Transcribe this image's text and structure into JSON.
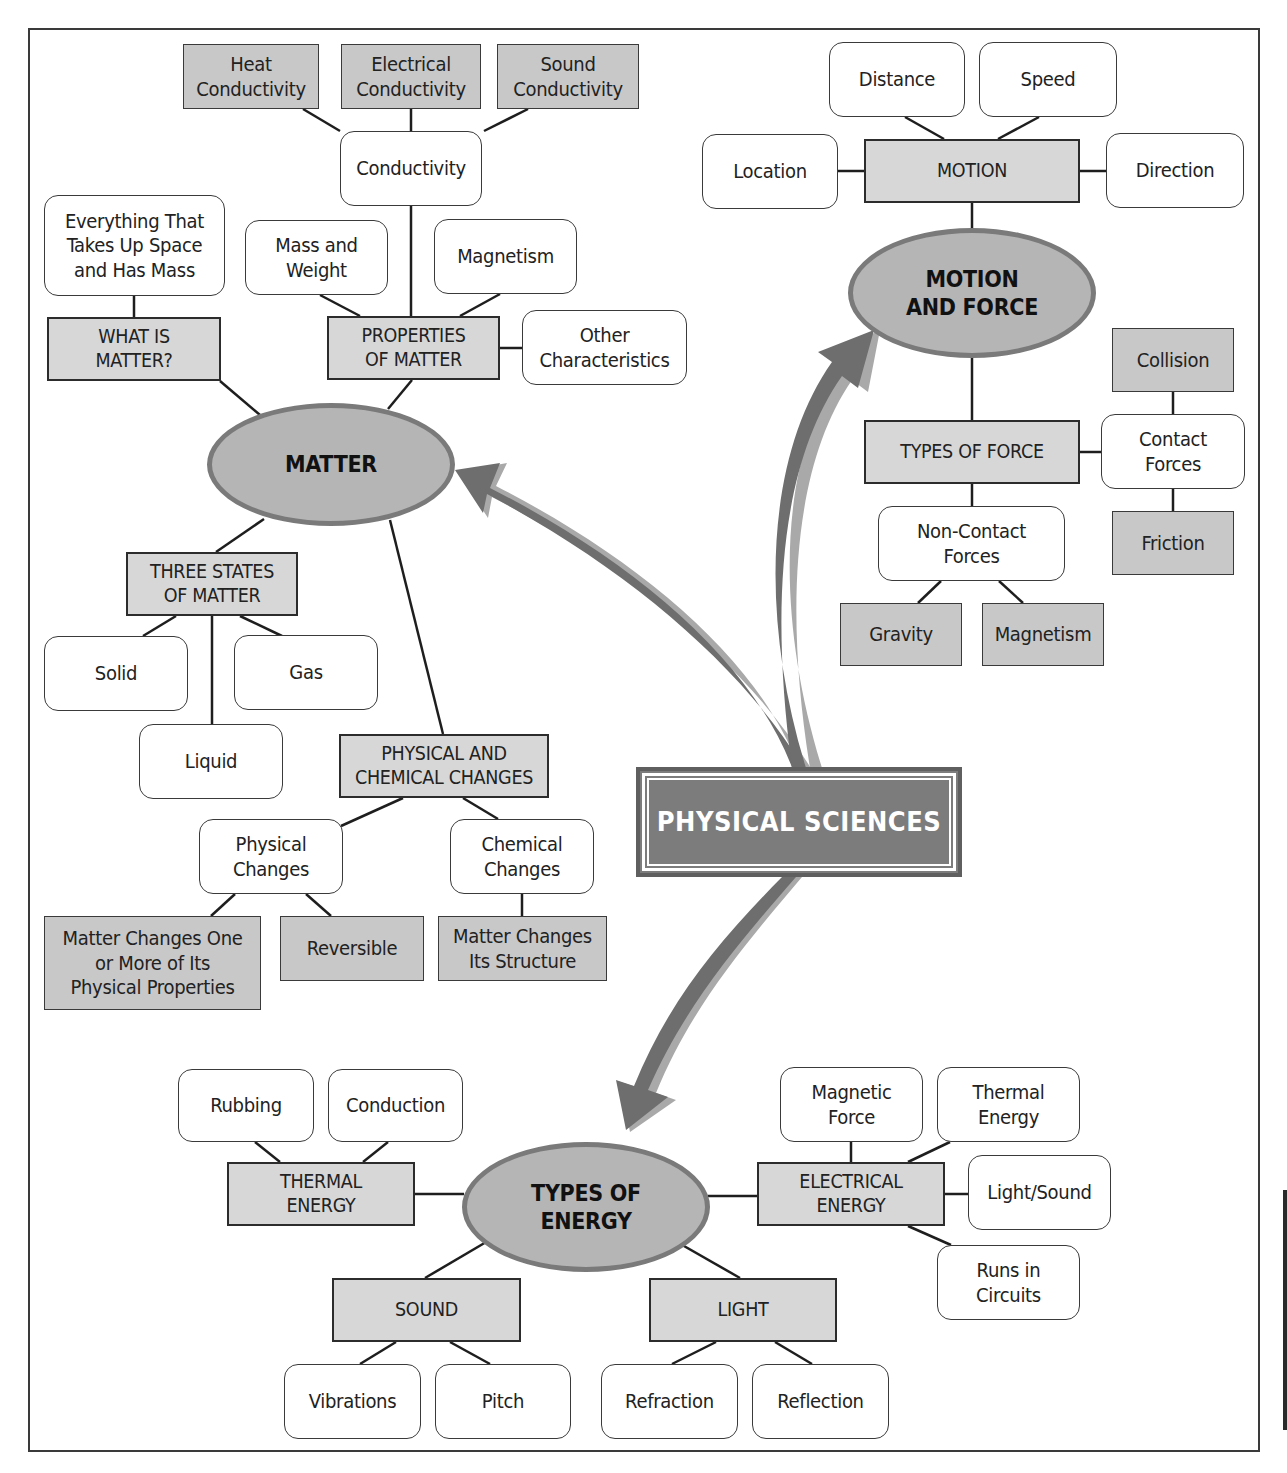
{
  "title": "PHYSICAL SCIENCES",
  "colors": {
    "root_fill": "#7c7c7c",
    "oval_fill": "#b5b5b5",
    "oval_border": "#7a7a7a",
    "category_fill": "#d7d7d7",
    "leaf_fill": "#c8c8c8",
    "detail_fill": "#ffffff",
    "arrow_fill": "#6e6e6e",
    "arrow_shadow": "#a9a9a9",
    "line": "#1e1e1e"
  },
  "nodes": {
    "root": {
      "label": "PHYSICAL SCIENCES",
      "type": "root",
      "x": 636,
      "y": 767,
      "w": 326,
      "h": 110
    },
    "matter": {
      "label": "MATTER",
      "type": "oval",
      "x": 207,
      "y": 403,
      "w": 248,
      "h": 123
    },
    "motion_force": {
      "label": "MOTION\nAND FORCE",
      "type": "oval",
      "x": 848,
      "y": 228,
      "w": 248,
      "h": 130
    },
    "types_energy": {
      "label": "TYPES OF\nENERGY",
      "type": "oval",
      "x": 462,
      "y": 1142,
      "w": 248,
      "h": 130
    },
    "heat_cond": {
      "label": "Heat\nConductivity",
      "type": "leaf",
      "x": 183,
      "y": 44,
      "w": 136,
      "h": 65
    },
    "elec_cond": {
      "label": "Electrical\nConductivity",
      "type": "leaf",
      "x": 341,
      "y": 44,
      "w": 140,
      "h": 65
    },
    "sound_cond": {
      "label": "Sound\nConductivity",
      "type": "leaf",
      "x": 497,
      "y": 44,
      "w": 142,
      "h": 65
    },
    "conductivity": {
      "label": "Conductivity",
      "type": "round",
      "x": 340,
      "y": 131,
      "w": 142,
      "h": 75
    },
    "everything": {
      "label": "Everything That\nTakes Up Space\nand Has Mass",
      "type": "round",
      "x": 44,
      "y": 195,
      "w": 181,
      "h": 101
    },
    "mass_weight": {
      "label": "Mass and\nWeight",
      "type": "round",
      "x": 245,
      "y": 220,
      "w": 143,
      "h": 75
    },
    "magnetism_p": {
      "label": "Magnetism",
      "type": "round",
      "x": 434,
      "y": 219,
      "w": 143,
      "h": 75
    },
    "what_is_matter": {
      "label": "WHAT IS\nMATTER?",
      "type": "cat",
      "x": 47,
      "y": 317,
      "w": 174,
      "h": 64
    },
    "properties": {
      "label": "PROPERTIES\nOF MATTER",
      "type": "cat",
      "x": 327,
      "y": 316,
      "w": 173,
      "h": 64
    },
    "other_char": {
      "label": "Other\nCharacteristics",
      "type": "round",
      "x": 522,
      "y": 310,
      "w": 165,
      "h": 75
    },
    "three_states": {
      "label": "THREE STATES\nOF MATTER",
      "type": "cat",
      "x": 126,
      "y": 552,
      "w": 172,
      "h": 64
    },
    "solid": {
      "label": "Solid",
      "type": "round",
      "x": 44,
      "y": 636,
      "w": 144,
      "h": 75
    },
    "gas": {
      "label": "Gas",
      "type": "round",
      "x": 234,
      "y": 635,
      "w": 144,
      "h": 75
    },
    "liquid": {
      "label": "Liquid",
      "type": "round",
      "x": 139,
      "y": 724,
      "w": 144,
      "h": 75
    },
    "phys_chem": {
      "label": "PHYSICAL AND\nCHEMICAL CHANGES",
      "type": "cat",
      "x": 339,
      "y": 734,
      "w": 210,
      "h": 64
    },
    "physical_changes": {
      "label": "Physical\nChanges",
      "type": "round",
      "x": 199,
      "y": 819,
      "w": 144,
      "h": 75
    },
    "chemical_changes": {
      "label": "Chemical\nChanges",
      "type": "round",
      "x": 450,
      "y": 819,
      "w": 144,
      "h": 75
    },
    "matter_changes_one": {
      "label": "Matter Changes One\nor More of Its\nPhysical Properties",
      "type": "leaf",
      "x": 44,
      "y": 916,
      "w": 217,
      "h": 94
    },
    "reversible": {
      "label": "Reversible",
      "type": "leaf",
      "x": 280,
      "y": 916,
      "w": 144,
      "h": 65
    },
    "matter_changes_struct": {
      "label": "Matter Changes\nIts Structure",
      "type": "leaf",
      "x": 438,
      "y": 916,
      "w": 169,
      "h": 65
    },
    "distance": {
      "label": "Distance",
      "type": "round",
      "x": 829,
      "y": 42,
      "w": 136,
      "h": 75
    },
    "speed": {
      "label": "Speed",
      "type": "round",
      "x": 979,
      "y": 42,
      "w": 138,
      "h": 75
    },
    "location": {
      "label": "Location",
      "type": "round",
      "x": 702,
      "y": 134,
      "w": 136,
      "h": 75
    },
    "motion": {
      "label": "MOTION",
      "type": "cat",
      "x": 864,
      "y": 139,
      "w": 216,
      "h": 64
    },
    "direction": {
      "label": "Direction",
      "type": "round",
      "x": 1106,
      "y": 133,
      "w": 138,
      "h": 75
    },
    "collision": {
      "label": "Collision",
      "type": "leaf",
      "x": 1112,
      "y": 328,
      "w": 122,
      "h": 64
    },
    "types_force": {
      "label": "TYPES OF FORCE",
      "type": "cat",
      "x": 864,
      "y": 420,
      "w": 216,
      "h": 64
    },
    "contact_forces": {
      "label": "Contact\nForces",
      "type": "round",
      "x": 1101,
      "y": 414,
      "w": 144,
      "h": 75
    },
    "non_contact": {
      "label": "Non-Contact\nForces",
      "type": "round",
      "x": 878,
      "y": 506,
      "w": 187,
      "h": 75
    },
    "friction": {
      "label": "Friction",
      "type": "leaf",
      "x": 1112,
      "y": 511,
      "w": 122,
      "h": 64
    },
    "gravity": {
      "label": "Gravity",
      "type": "leaf",
      "x": 840,
      "y": 603,
      "w": 122,
      "h": 63
    },
    "magnetism_f": {
      "label": "Magnetism",
      "type": "leaf",
      "x": 982,
      "y": 603,
      "w": 122,
      "h": 63
    },
    "rubbing": {
      "label": "Rubbing",
      "type": "round",
      "x": 178,
      "y": 1069,
      "w": 136,
      "h": 73
    },
    "conduction": {
      "label": "Conduction",
      "type": "round",
      "x": 328,
      "y": 1069,
      "w": 135,
      "h": 73
    },
    "thermal_energy_cat": {
      "label": "THERMAL\nENERGY",
      "type": "cat",
      "x": 227,
      "y": 1162,
      "w": 188,
      "h": 64
    },
    "sound": {
      "label": "SOUND",
      "type": "cat",
      "x": 332,
      "y": 1278,
      "w": 189,
      "h": 64
    },
    "light": {
      "label": "LIGHT",
      "type": "cat",
      "x": 649,
      "y": 1278,
      "w": 188,
      "h": 64
    },
    "vibrations": {
      "label": "Vibrations",
      "type": "round",
      "x": 284,
      "y": 1364,
      "w": 137,
      "h": 75
    },
    "pitch": {
      "label": "Pitch",
      "type": "round",
      "x": 435,
      "y": 1364,
      "w": 136,
      "h": 75
    },
    "refraction": {
      "label": "Refraction",
      "type": "round",
      "x": 601,
      "y": 1364,
      "w": 137,
      "h": 75
    },
    "reflection": {
      "label": "Reflection",
      "type": "round",
      "x": 752,
      "y": 1364,
      "w": 137,
      "h": 75
    },
    "electrical_energy": {
      "label": "ELECTRICAL\nENERGY",
      "type": "cat",
      "x": 757,
      "y": 1162,
      "w": 188,
      "h": 64
    },
    "magnetic_force": {
      "label": "Magnetic\nForce",
      "type": "round",
      "x": 780,
      "y": 1067,
      "w": 143,
      "h": 75
    },
    "thermal_energy_leaf": {
      "label": "Thermal\nEnergy",
      "type": "round",
      "x": 937,
      "y": 1067,
      "w": 143,
      "h": 75
    },
    "light_sound": {
      "label": "Light/Sound",
      "type": "round",
      "x": 968,
      "y": 1155,
      "w": 143,
      "h": 75
    },
    "runs_circuits": {
      "label": "Runs in\nCircuits",
      "type": "round",
      "x": 937,
      "y": 1245,
      "w": 143,
      "h": 75
    }
  },
  "links": [
    [
      303,
      109,
      340,
      131
    ],
    [
      411,
      109,
      411,
      131
    ],
    [
      528,
      109,
      484,
      131
    ],
    [
      411,
      206,
      411,
      316
    ],
    [
      320,
      295,
      360,
      316
    ],
    [
      500,
      294,
      460,
      316
    ],
    [
      500,
      348,
      522,
      348
    ],
    [
      134,
      296,
      134,
      317
    ],
    [
      220,
      381,
      260,
      415
    ],
    [
      412,
      380,
      388,
      409
    ],
    [
      264,
      519,
      216,
      552
    ],
    [
      176,
      616,
      143,
      636
    ],
    [
      212,
      616,
      212,
      724
    ],
    [
      240,
      616,
      282,
      636
    ],
    [
      390,
      520,
      443,
      734
    ],
    [
      403,
      798,
      341,
      826
    ],
    [
      463,
      798,
      498,
      819
    ],
    [
      235,
      894,
      211,
      916
    ],
    [
      306,
      894,
      331,
      916
    ],
    [
      522,
      894,
      522,
      916
    ],
    [
      905,
      117,
      944,
      139
    ],
    [
      1039,
      117,
      998,
      139
    ],
    [
      838,
      171,
      864,
      171
    ],
    [
      1080,
      171,
      1106,
      171
    ],
    [
      972,
      203,
      972,
      230
    ],
    [
      972,
      356,
      972,
      420
    ],
    [
      1080,
      452,
      1101,
      452
    ],
    [
      1173,
      392,
      1173,
      414
    ],
    [
      1173,
      489,
      1173,
      511
    ],
    [
      972,
      484,
      972,
      506
    ],
    [
      941,
      581,
      918,
      603
    ],
    [
      999,
      581,
      1023,
      603
    ],
    [
      255,
      1142,
      280,
      1162
    ],
    [
      388,
      1142,
      363,
      1162
    ],
    [
      415,
      1194,
      464,
      1194
    ],
    [
      493,
      1238,
      425,
      1278
    ],
    [
      670,
      1238,
      740,
      1278
    ],
    [
      396,
      1342,
      360,
      1364
    ],
    [
      450,
      1342,
      490,
      1364
    ],
    [
      716,
      1342,
      672,
      1364
    ],
    [
      775,
      1342,
      812,
      1364
    ],
    [
      708,
      1196,
      757,
      1196
    ],
    [
      851,
      1142,
      851,
      1162
    ],
    [
      950,
      1142,
      908,
      1162
    ],
    [
      945,
      1194,
      968,
      1194
    ],
    [
      908,
      1226,
      951,
      1245
    ]
  ],
  "arrows": [
    {
      "id": "to_matter",
      "from": "root",
      "to": "matter"
    },
    {
      "id": "to_motion_force",
      "from": "root",
      "to": "motion_force"
    },
    {
      "id": "to_types_energy",
      "from": "root",
      "to": "types_energy"
    }
  ]
}
